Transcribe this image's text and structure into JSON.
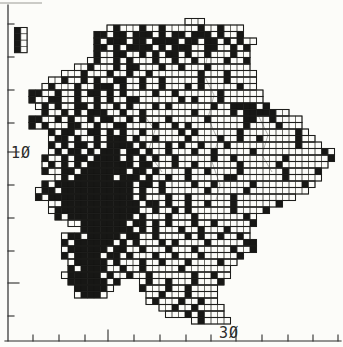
{
  "colors": {
    "ink": "#2b2b2b",
    "paper": "#fcfcf9",
    "fill": "#171715",
    "grid_line": "#4a4a46"
  },
  "axes": {
    "left": {
      "label": "1Ø",
      "axis_x": 8,
      "y1": 5,
      "y2": 341,
      "minor_ticks": [
        24,
        57,
        90,
        123,
        185,
        218,
        251,
        316
      ],
      "major_ticks": [
        152,
        283
      ]
    },
    "bottom": {
      "label": "3Ø",
      "axis_y": 341,
      "x1": 5,
      "x2": 341,
      "minor_ticks": [
        33,
        59,
        85,
        134,
        160,
        186,
        211,
        262,
        288,
        313,
        338
      ],
      "major_ticks": [
        108,
        236
      ]
    }
  },
  "map": {
    "cell_size": 6.5,
    "origin_x": 29,
    "origin_y": 12,
    "legend": {
      "filled_square": "record present",
      "open_square": "surveyed square"
    },
    "inset": {
      "x": 14.5,
      "y": 27.5,
      "cell_size": 6.3,
      "rows": [
        "#.",
        "#.",
        "#.",
        "#."
      ]
    },
    "rows": [
      {
        "r": 1,
        "segs": [
          {
            "c": 24,
            "b": "..."
          }
        ]
      },
      {
        "r": 2,
        "segs": [
          {
            "c": 12,
            "b": ".#...#..#.....#..#..."
          }
        ]
      },
      {
        "r": 3,
        "segs": [
          {
            "c": 10,
            "b": "##.##.###.#.##.###.#..#"
          }
        ]
      },
      {
        "r": 4,
        "segs": [
          {
            "c": 10,
            "b": "#.###.##.####.##.##.#.#.."
          }
        ]
      },
      {
        "r": 5,
        "segs": [
          {
            "c": 10,
            "b": "##.#.####.#.###..##..#.#"
          }
        ]
      },
      {
        "r": 6,
        "segs": [
          {
            "c": 10,
            "b": "#..##..#.#.##.#..#...#.."
          }
        ]
      },
      {
        "r": 7,
        "segs": [
          {
            "c": 9,
            "b": ".#..#.#...#..#..#....#..#"
          }
        ]
      },
      {
        "r": 8,
        "segs": [
          {
            "c": 7,
            "b": "..#...#.##...#..#...#......"
          }
        ]
      },
      {
        "r": 9,
        "segs": [
          {
            "c": 5,
            "b": "...#...#..#..#.......#...#...."
          }
        ]
      },
      {
        "r": 10,
        "segs": [
          {
            "c": 3,
            "b": "..#..#.#..##..#..#.....#...#...."
          }
        ]
      },
      {
        "r": 11,
        "segs": [
          {
            "c": 2,
            "b": ".#...#..###.#..#..#...#.#.....#.."
          }
        ]
      },
      {
        "r": 12,
        "segs": [
          {
            "c": 0,
            "b": "##..#..#.##.#.#....#..#......#......"
          }
        ]
      },
      {
        "r": 13,
        "segs": [
          {
            "c": 0,
            "b": "#..##..#..#.#..##......#.#...#......"
          }
        ]
      },
      {
        "r": 14,
        "segs": [
          {
            "c": 1,
            "b": ".#.#..##.#..#.#...#.#......#..####.#"
          }
        ]
      },
      {
        "r": 15,
        "segs": [
          {
            "c": 2,
            "b": "#..#.#.###..#..#.......#.....#.#####.."
          }
        ]
      },
      {
        "r": 16,
        "segs": [
          {
            "c": 0,
            "b": "##..#.#..#.##..#.#...#.....#.....##..#...."
          }
        ]
      },
      {
        "r": 17,
        "segs": [
          {
            "c": 0,
            "b": "#.#...##..#..##....#..#.#........#....#..."
          }
        ]
      },
      {
        "r": 18,
        "segs": [
          {
            "c": 3,
            "b": "#.##..##.#.#..#.....#.#......#........#."
          }
        ]
      },
      {
        "r": 19,
        "segs": [
          {
            "c": 3,
            "b": ".##.#..#.###.#..#....#....#..#..#.....#.."
          }
        ]
      },
      {
        "r": 20,
        "segs": [
          {
            "c": 3,
            "b": "#.#.##.#.####.#...#.#..#...#..........#..."
          }
        ]
      },
      {
        "r": 21,
        "segs": [
          {
            "c": 3,
            "b": ".#.##.#.###.##.#..#...#..#.....#..........#."
          }
        ]
      },
      {
        "r": 22,
        "segs": [
          {
            "c": 2,
            "b": "#..#.##.####.#.#.#..#.....#..#.......#......#"
          }
        ]
      },
      {
        "r": 23,
        "segs": [
          {
            "c": 2,
            "b": ".#.#.#.#######.##...#..#......#.....#......."
          }
        ]
      },
      {
        "r": 24,
        "segs": [
          {
            "c": 2,
            "b": "#..##.#######.##.#....#..#....#......#....#"
          }
        ]
      },
      {
        "r": 25,
        "segs": [
          {
            "c": 4,
            "b": ".#.######.###.#..#..#.....##.......#....."
          }
        ]
      },
      {
        "r": 26,
        "segs": [
          {
            "c": 2,
            "b": "#.############.##.#....#..#.....#.......#."
          }
        ]
      },
      {
        "r": 27,
        "segs": [
          {
            "c": 1,
            "b": ".##.###########.#..#......#.....#........."
          }
        ]
      },
      {
        "r": 28,
        "segs": [
          {
            "c": 1,
            "b": "#.#############.#...#..#......#........."
          }
        ]
      },
      {
        "r": 29,
        "segs": [
          {
            "c": 3,
            "b": "..############.##.#..#..#...#......#"
          }
        ]
      },
      {
        "r": 30,
        "segs": [
          {
            "c": 3,
            "b": ".#############..#..#.#......#....#"
          }
        ]
      },
      {
        "r": 31,
        "segs": [
          {
            "c": 4,
            "b": "#.##########.#...#...#.......#."
          }
        ]
      },
      {
        "r": 32,
        "segs": [
          {
            "c": 6,
            "b": "..#######.##.#.#...#..#.....#"
          }
        ]
      },
      {
        "r": 33,
        "segs": [
          {
            "c": 8,
            "b": "########.#.#...#..#...#..."
          }
        ]
      },
      {
        "r": 34,
        "segs": [
          {
            "c": 5,
            "b": ".##.#####.##..#....#.#..#..#."
          }
        ]
      },
      {
        "r": 35,
        "segs": [
          {
            "c": 5,
            "b": "#.######.#.#...#.#....#.....##"
          }
        ]
      },
      {
        "r": 36,
        "segs": [
          {
            "c": 5,
            "b": ".######.##..#...#...#.....#..#"
          }
        ]
      },
      {
        "r": 37,
        "segs": [
          {
            "c": 5,
            "b": "#.####.##.#...#..#...#.....#"
          }
        ]
      },
      {
        "r": 38,
        "segs": [
          {
            "c": 6,
            "b": ".#####.#...#..#...#....#.."
          }
        ]
      },
      {
        "r": 39,
        "segs": [
          {
            "c": 6,
            "b": "#.####..#..#.....#......."
          }
        ]
      },
      {
        "r": 40,
        "segs": [
          {
            "c": 5,
            "b": ".#####.#..#..#......#..#.."
          }
        ]
      },
      {
        "r": 41,
        "segs": [
          {
            "c": 6,
            "b": "######.#"
          },
          {
            "c": 17,
            "b": ".#..#...#...#"
          }
        ]
      },
      {
        "r": 42,
        "segs": [
          {
            "c": 7,
            "b": "#####."
          },
          {
            "c": 17,
            "b": "#...#..#...."
          }
        ]
      },
      {
        "r": 43,
        "segs": [
          {
            "c": 7,
            "b": ".###."
          },
          {
            "c": 18,
            "b": "..#...#...."
          }
        ]
      },
      {
        "r": 44,
        "segs": [
          {
            "c": 18,
            "b": ".#...#..#.."
          }
        ]
      },
      {
        "r": 45,
        "segs": [
          {
            "c": 20,
            "b": "..#..#...."
          }
        ]
      },
      {
        "r": 46,
        "segs": [
          {
            "c": 21,
            "b": "...#.#..."
          }
        ]
      },
      {
        "r": 47,
        "segs": [
          {
            "c": 25,
            "b": ".#...."
          }
        ]
      }
    ],
    "rivers": [
      {
        "points": "208,52 204,75 214,95 208,118 218,140 212,162 220,185 216,200"
      },
      {
        "points": "140,110 155,130 148,152 162,172"
      },
      {
        "points": "258,115 268,135 262,155 272,172"
      }
    ]
  }
}
